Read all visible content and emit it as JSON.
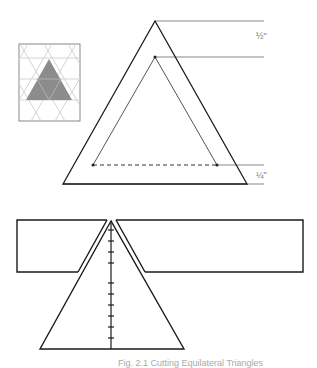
{
  "labels": {
    "half_inch": "½\"",
    "quarter_inch": "¼\""
  },
  "caption": "Fig. 2.1  Cutting Equilateral Triangles",
  "colors": {
    "line": "#1a1a1a",
    "thin_line": "#555555",
    "leader": "#888888",
    "fill_gray": "#8c8c8c",
    "grid": "#d0d0d0",
    "thumb_border": "#888888"
  }
}
